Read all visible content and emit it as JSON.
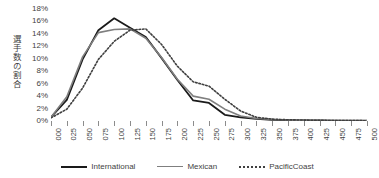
{
  "chart_data": {
    "type": "line",
    "title": "",
    "xlabel": "",
    "ylabel": "選手数の割合",
    "ylim": [
      0,
      18
    ],
    "ytick_step": 2,
    "grid": false,
    "legend_position": "bottom",
    "x": [
      "000",
      "025",
      "050",
      "075",
      "100",
      "125",
      "150",
      "175",
      "200",
      "225",
      "250",
      "275",
      "300",
      "325",
      "350",
      "375",
      "400",
      "425",
      "450",
      "475",
      "500"
    ],
    "y_ticks": [
      "0%",
      "2%",
      "4%",
      "6%",
      "8%",
      "10%",
      "12%",
      "14%",
      "16%",
      "18%"
    ],
    "y_tick_values": [
      0,
      2,
      4,
      6,
      8,
      10,
      12,
      14,
      16,
      18
    ],
    "series": [
      {
        "name": "International",
        "color": "#1a1a1a",
        "style": "solid",
        "width": 1.8,
        "values": [
          0.6,
          3.4,
          9.9,
          14.6,
          16.5,
          15.0,
          13.5,
          10.1,
          6.6,
          3.3,
          2.9,
          1.0,
          0.6,
          0.35,
          0.2,
          0.12,
          0.1,
          0.08,
          0.06,
          0.05,
          0.05
        ]
      },
      {
        "name": "Mexican",
        "color": "#7f7f7f",
        "style": "solid",
        "width": 1.6,
        "values": [
          0.6,
          3.9,
          10.3,
          14.2,
          14.7,
          14.8,
          13.3,
          10.2,
          6.7,
          4.0,
          3.5,
          1.9,
          0.8,
          0.4,
          0.25,
          0.15,
          0.1,
          0.08,
          0.06,
          0.05,
          0.05
        ]
      },
      {
        "name": "PacificCoast",
        "color": "#3f3f3f",
        "style": "dotted",
        "width": 1.6,
        "values": [
          0.5,
          1.9,
          5.3,
          9.9,
          12.8,
          14.6,
          14.8,
          12.3,
          8.8,
          6.3,
          5.6,
          3.5,
          1.6,
          0.6,
          0.3,
          0.2,
          0.15,
          0.1,
          0.08,
          0.06,
          0.05
        ]
      }
    ]
  },
  "legend": {
    "items": [
      {
        "label": "International"
      },
      {
        "label": "Mexican"
      },
      {
        "label": "PacificCoast"
      }
    ]
  }
}
